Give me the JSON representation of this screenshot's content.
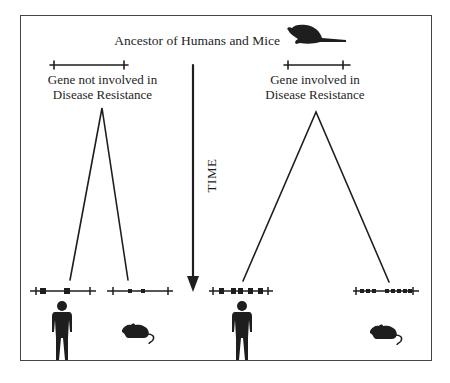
{
  "diagram": {
    "title": "Ancestor of Humans and Mice",
    "time_label": "TIME",
    "left_panel": {
      "gene_label_line1": "Gene not involved in",
      "gene_label_line2": "Disease Resistance",
      "descendants": [
        "human",
        "mouse"
      ]
    },
    "right_panel": {
      "gene_label_line1": "Gene involved in",
      "gene_label_line2": "Disease Resistance",
      "descendants": [
        "human",
        "mouse"
      ]
    },
    "colors": {
      "ink": "#1e1e1e",
      "frame": "#444444",
      "background": "#ffffff"
    }
  }
}
